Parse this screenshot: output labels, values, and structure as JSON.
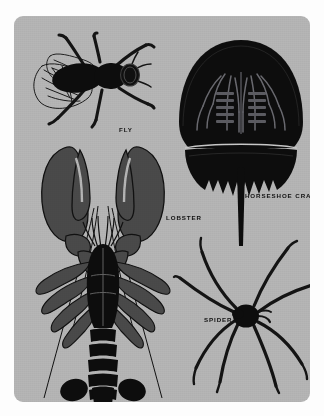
{
  "plate": {
    "kind": "illustration-plate",
    "title_visible": false,
    "background_color": "#b6b6b6",
    "border_color": "#fdfdfd",
    "ink_color": "#0d0d0d",
    "mid_tone_color": "#4a4a4a"
  },
  "figures": [
    {
      "id": "fly",
      "label": "FLY",
      "icon": "fly-icon",
      "body_color": "#0d0d0d",
      "detail_color": "#2b2b2b",
      "orientation": "dorsal view, head to the right"
    },
    {
      "id": "horseshoe-crab",
      "label": "HORSESHOE CRAB",
      "icon": "horseshoe-crab-icon",
      "body_color": "#0d0d0d",
      "detail_color": "#56565b",
      "orientation": "ventral view, telson pointing down"
    },
    {
      "id": "lobster",
      "label": "LOBSTER",
      "icon": "lobster-icon",
      "body_color": "#0d0d0d",
      "detail_color": "#4a4a4a",
      "orientation": "dorsal view, claws up, tail down"
    },
    {
      "id": "spider",
      "label": "SPIDER",
      "icon": "spider-icon",
      "body_color": "#0d0d0d",
      "detail_color": "#111111",
      "orientation": "dorsal view, eight legs radiating"
    }
  ]
}
